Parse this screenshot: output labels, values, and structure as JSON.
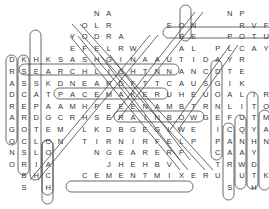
{
  "puzzle": {
    "type": "word-search",
    "grid_origin": {
      "x": 12,
      "y": 13,
      "dx": 12.1,
      "dy": 11.6
    },
    "cells": [
      {
        "r": 0,
        "c": 7,
        "ch": "N"
      },
      {
        "r": 0,
        "c": 8,
        "ch": "A"
      },
      {
        "r": 0,
        "c": 18,
        "ch": "N"
      },
      {
        "r": 0,
        "c": 19,
        "ch": "P"
      },
      {
        "r": 1,
        "c": 6,
        "ch": "O"
      },
      {
        "r": 1,
        "c": 7,
        "ch": "L"
      },
      {
        "r": 1,
        "c": 8,
        "ch": "R"
      },
      {
        "r": 1,
        "c": 13,
        "ch": "E"
      },
      {
        "r": 1,
        "c": 14,
        "ch": "O"
      },
      {
        "r": 1,
        "c": 15,
        "ch": "N"
      },
      {
        "r": 1,
        "c": 18,
        "ch": "R"
      },
      {
        "r": 1,
        "c": 19,
        "ch": "V"
      },
      {
        "r": 1,
        "c": 20,
        "ch": "F"
      },
      {
        "r": 2,
        "c": 5,
        "ch": "Y"
      },
      {
        "r": 2,
        "c": 6,
        "ch": "O"
      },
      {
        "r": 2,
        "c": 7,
        "ch": "D"
      },
      {
        "r": 2,
        "c": 8,
        "ch": "R"
      },
      {
        "r": 2,
        "c": 9,
        "ch": "A"
      },
      {
        "r": 2,
        "c": 14,
        "ch": "R"
      },
      {
        "r": 2,
        "c": 15,
        "ch": "E"
      },
      {
        "r": 2,
        "c": 18,
        "ch": "P"
      },
      {
        "r": 2,
        "c": 19,
        "ch": "O"
      },
      {
        "r": 2,
        "c": 20,
        "ch": "T"
      },
      {
        "r": 2,
        "c": 21,
        "ch": "U"
      },
      {
        "r": 2,
        "c": 22,
        "ch": "S"
      },
      {
        "r": 3,
        "c": 5,
        "ch": "E"
      },
      {
        "r": 3,
        "c": 6,
        "ch": "F"
      },
      {
        "r": 3,
        "c": 7,
        "ch": "E"
      },
      {
        "r": 3,
        "c": 8,
        "ch": "L"
      },
      {
        "r": 3,
        "c": 9,
        "ch": "R"
      },
      {
        "r": 3,
        "c": 10,
        "ch": "W"
      },
      {
        "r": 3,
        "c": 14,
        "ch": "A"
      },
      {
        "r": 3,
        "c": 15,
        "ch": "L"
      },
      {
        "r": 3,
        "c": 17,
        "ch": "P"
      },
      {
        "r": 3,
        "c": 18,
        "ch": "L"
      },
      {
        "r": 3,
        "c": 19,
        "ch": "C"
      },
      {
        "r": 3,
        "c": 20,
        "ch": "A"
      },
      {
        "r": 3,
        "c": 21,
        "ch": "Y"
      },
      {
        "r": 3,
        "c": 22,
        "ch": "N"
      }
    ],
    "rows": [
      "       NA         NP   ",
      "      OLR    EON   RVF  ",
      "     YODRA    RE  POTUS",
      "     EFELRW   AL PLCAYN",
      "DKHKSASHGINAAUTIDAYR",
      "RSEARCHLIGHTNNANCDTE",
      "ASSKDNEARDFTTCAUSGIK",
      "DCATPACEMAKERUHEUOALIR",
      "REPAAMHPEEENAMBTRNLITO",
      "ARDGCRHSERAINBOWGEFUTM",
      "GOTEM LKDBGEGLWE ICQYA",
      "OCLCN TIRNIRFELP PANHN",
      "NSLO   NGEARERF  CAAY",
      "ORIA    JHEHBV   TRWD",
      " BHC  CEMENTMIXERU UTK",
      " S H              S H"
    ],
    "found_words": [
      "POTUS",
      "SEARCHLIGHT",
      "PACEMAKER",
      "RAINBOW",
      "CEMENT MIXER",
      "CACTUS",
      "CHRONOLOGY",
      "DRAGON",
      "SPLIT",
      "CLOACH"
    ],
    "footer_text": ""
  },
  "colors": {
    "letter": "#333333",
    "outline": "#444444",
    "background": "#ffffff"
  }
}
